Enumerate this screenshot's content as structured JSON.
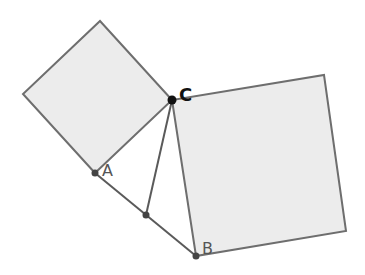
{
  "diagram": {
    "type": "pythagorean-squares",
    "colors": {
      "square_fill": "#ececec",
      "square_stroke": "#6e6e6e",
      "segment_stroke": "#5a5a5a",
      "point_fill": "#444444",
      "point_c_fill": "#111111"
    },
    "points": {
      "A": {
        "label": "A",
        "x": 95,
        "y": 173
      },
      "B": {
        "label": "B",
        "x": 196,
        "y": 256
      },
      "C": {
        "label": "C",
        "x": 172,
        "y": 100
      },
      "H": {
        "label": "",
        "x": 146,
        "y": 215
      }
    },
    "squares": [
      {
        "name": "square-on-AC",
        "points": "95,173 172,100 100,21 23,94"
      },
      {
        "name": "square-on-CB",
        "points": "172,100 196,256 346,231 324,75"
      }
    ],
    "segments": [
      {
        "name": "segment-AB",
        "from": "A",
        "to": "B"
      },
      {
        "name": "segment-CH",
        "from": "C",
        "to": "H"
      }
    ],
    "labels": {
      "A": "A",
      "B": "B",
      "C": "C"
    }
  }
}
